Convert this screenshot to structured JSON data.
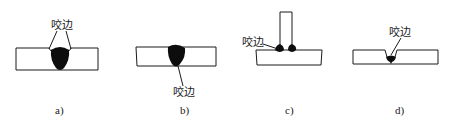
{
  "figure": {
    "panels": [
      {
        "id": "a",
        "caption": "a)",
        "callout_label": "咬边",
        "description": "butt weld with undercut at both toes on top surface"
      },
      {
        "id": "b",
        "caption": "b)",
        "callout_label": "咬边",
        "description": "butt weld with undercut at root on bottom surface"
      },
      {
        "id": "c",
        "caption": "c)",
        "callout_label": "咬边",
        "description": "T-joint fillet welds with undercut at weld toe"
      },
      {
        "id": "d",
        "caption": "d)",
        "callout_label": "咬边",
        "description": "single-sided weld with undercut in groove"
      }
    ],
    "colors": {
      "line": "#1a1a1a",
      "weld": "#0d0d0d",
      "background": "#ffffff"
    }
  }
}
